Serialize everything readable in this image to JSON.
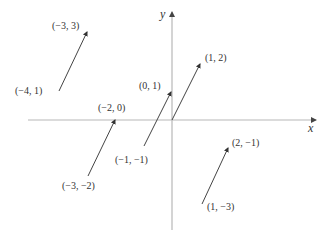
{
  "diagram": {
    "axes": {
      "x_label": "x",
      "y_label": "y",
      "origin_px": [
        172,
        120
      ],
      "x_axis_px": [
        28,
        316
      ],
      "y_axis_px": [
        12,
        230
      ],
      "color": "#b0b0b0"
    },
    "arrow_color": "#444444",
    "arrows": [
      {
        "start_label": "(−4, 1)",
        "end_label": "(−3, 3)",
        "start": [
          -4,
          1
        ],
        "end": [
          -3,
          3
        ],
        "start_px": [
          59,
          91
        ],
        "end_px": [
          87,
          32
        ]
      },
      {
        "start_label": "(−1, −1)",
        "end_label": "(0, 1)",
        "start": [
          -1,
          -1
        ],
        "end": [
          0,
          1
        ],
        "start_px": [
          144,
          146
        ],
        "end_px": [
          171,
          92
        ]
      },
      {
        "start_label": "",
        "end_label": "(1, 2)",
        "start": [
          0,
          0
        ],
        "end": [
          1,
          2
        ],
        "start_px": [
          172,
          120
        ],
        "end_px": [
          200,
          64
        ]
      },
      {
        "start_label": "(−3, −2)",
        "end_label": "(−2, 0)",
        "start": [
          -3,
          -2
        ],
        "end": [
          -2,
          0
        ],
        "start_px": [
          88,
          176
        ],
        "end_px": [
          115,
          120
        ]
      },
      {
        "start_label": "(1, −3)",
        "end_label": "(2, −1)",
        "start": [
          1,
          -3
        ],
        "end": [
          2,
          -1
        ],
        "start_px": [
          202,
          204
        ],
        "end_px": [
          228,
          148
        ]
      }
    ],
    "labels": [
      {
        "text": "(−3, 3)",
        "x": 52,
        "y": 29
      },
      {
        "text": "(−4, 1)",
        "x": 15,
        "y": 94
      },
      {
        "text": "(0, 1)",
        "x": 139,
        "y": 89
      },
      {
        "text": "(1, 2)",
        "x": 205,
        "y": 61
      },
      {
        "text": "(−2, 0)",
        "x": 98,
        "y": 111
      },
      {
        "text": "(−1, −1)",
        "x": 115,
        "y": 163
      },
      {
        "text": "(−3, −2)",
        "x": 62,
        "y": 189
      },
      {
        "text": "(2, −1)",
        "x": 232,
        "y": 146
      },
      {
        "text": "(1, −3)",
        "x": 207,
        "y": 210
      }
    ]
  }
}
